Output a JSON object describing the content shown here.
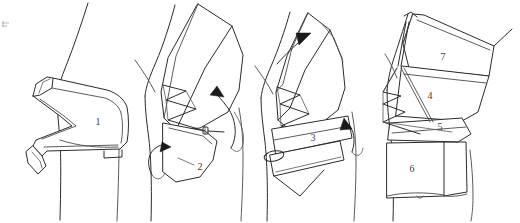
{
  "figure": {
    "width": 520,
    "height": 223,
    "background_color": "#ffffff",
    "ink_color": "#2b2b2b",
    "label_color": "#3a3a3a"
  },
  "panels": [
    {
      "id": "panel-1",
      "order": 1,
      "caption": "",
      "piece_labels": [
        {
          "text": "1",
          "x": 98,
          "y": 123
        }
      ],
      "arrows": []
    },
    {
      "id": "panel-2",
      "order": 2,
      "caption": "",
      "piece_labels": [
        {
          "text": "2",
          "x": 200,
          "y": 168
        }
      ],
      "arrows": [
        {
          "name": "arrow-up-right",
          "x": 217,
          "y": 90
        },
        {
          "name": "arrow-right-small",
          "x": 165,
          "y": 148
        }
      ]
    },
    {
      "id": "panel-3",
      "order": 3,
      "caption": "",
      "piece_labels": [
        {
          "text": "3",
          "x": 313,
          "y": 139
        }
      ],
      "arrows": [
        {
          "name": "arrow-up-right-top",
          "x": 307,
          "y": 38
        },
        {
          "name": "arrow-up-right-mid",
          "x": 350,
          "y": 121
        }
      ]
    },
    {
      "id": "panel-4",
      "order": 4,
      "caption": "",
      "piece_labels": [
        {
          "text": "7",
          "x": 443,
          "y": 58
        },
        {
          "text": "4",
          "x": 430,
          "y": 97
        },
        {
          "text": "5",
          "x": 440,
          "y": 128
        },
        {
          "text": "6",
          "x": 412,
          "y": 170
        }
      ],
      "arrows": []
    }
  ],
  "piece_numbers": [
    "1",
    "2",
    "3",
    "4",
    "5",
    "6",
    "7"
  ],
  "legend": {
    "visible": false,
    "entries": []
  }
}
